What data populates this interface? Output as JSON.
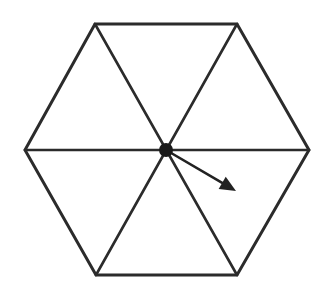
{
  "diagram": {
    "type": "hexagon-with-vector",
    "colors": {
      "background": "#ffffff",
      "stroke": "#2b2b2b",
      "center_dot": "#1a1a1a"
    },
    "center": {
      "x": 166,
      "y": 150
    },
    "vertices": [
      {
        "x": 95,
        "y": 24
      },
      {
        "x": 237,
        "y": 24
      },
      {
        "x": 309,
        "y": 150
      },
      {
        "x": 237,
        "y": 275
      },
      {
        "x": 96,
        "y": 275
      },
      {
        "x": 25,
        "y": 150
      }
    ],
    "center_dot_radius": 7,
    "arrow": {
      "from": {
        "x": 166,
        "y": 150
      },
      "to": {
        "x": 236,
        "y": 191
      }
    },
    "triangle_count": 6
  }
}
